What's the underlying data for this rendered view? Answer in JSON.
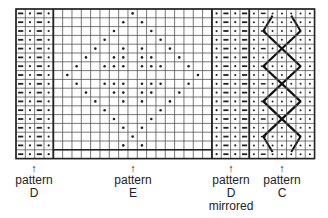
{
  "grid": {
    "origin_x": 16,
    "origin_y": 9,
    "cell_w": 9.33,
    "cell_h": 8.8,
    "rows": 17,
    "line_color": "#555555",
    "thick_color": "#222222",
    "dot_color": "#222222"
  },
  "sections": [
    {
      "id": "D",
      "cols": 4,
      "kind": "rib",
      "row_cells": [
        "dash",
        "dot",
        "dash",
        "dot"
      ]
    },
    {
      "id": "E",
      "cols": 17,
      "kind": "lace",
      "dots": [
        [
          8
        ],
        [
          7,
          9
        ],
        [
          6,
          10
        ],
        [
          5,
          11
        ],
        [
          4,
          7,
          9,
          12
        ],
        [
          3,
          6,
          7,
          9,
          10,
          13
        ],
        [
          2,
          5,
          6,
          7,
          9,
          10,
          11,
          14
        ],
        [
          1,
          15
        ],
        [
          2,
          5,
          6,
          7,
          9,
          10,
          11,
          14
        ],
        [
          3,
          6,
          7,
          9,
          10,
          13
        ],
        [
          4,
          7,
          9,
          12
        ],
        [
          5,
          11
        ],
        [
          6,
          10
        ],
        [
          7,
          9
        ],
        [
          8
        ],
        [
          7,
          9
        ],
        []
      ]
    },
    {
      "id": "D-mirrored",
      "cols": 4,
      "kind": "rib",
      "row_cells": [
        "dot",
        "dash",
        "dot",
        "dash"
      ]
    },
    {
      "id": "C",
      "cols": 7,
      "kind": "cable",
      "crosses": [
        {
          "r0": 2.5,
          "r1": 6.5
        },
        {
          "r0": 6.5,
          "r1": 10.5
        },
        {
          "r0": 10.5,
          "r1": 14.5
        }
      ],
      "top_half": {
        "r0": 0.3,
        "r1": 2.5
      },
      "bottom_half": {
        "r0": 14.5,
        "r1": 16.7
      }
    }
  ],
  "labels": [
    {
      "text_lines": [
        "pattern",
        "D"
      ],
      "x": 34
    },
    {
      "text_lines": [
        "pattern",
        "E"
      ],
      "x": 133
    },
    {
      "text_lines": [
        "pattern",
        "D",
        "mirrored"
      ],
      "x": 231
    },
    {
      "text_lines": [
        "pattern",
        "C"
      ],
      "x": 282
    }
  ],
  "arrow_glyph": "↑"
}
